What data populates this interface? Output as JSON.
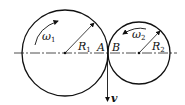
{
  "diagram": {
    "type": "two rolling disks in contact",
    "disk1": {
      "omega_label": "ω",
      "omega_sub": "1",
      "radius_label": "R",
      "radius_sub": "1",
      "contact_label": "A"
    },
    "disk2": {
      "omega_label": "ω",
      "omega_sub": "2",
      "radius_label": "R",
      "radius_sub": "2",
      "contact_label": "B"
    },
    "velocity_label": "v",
    "colors": {
      "stroke": "#111111",
      "background": "#ffffff"
    }
  }
}
